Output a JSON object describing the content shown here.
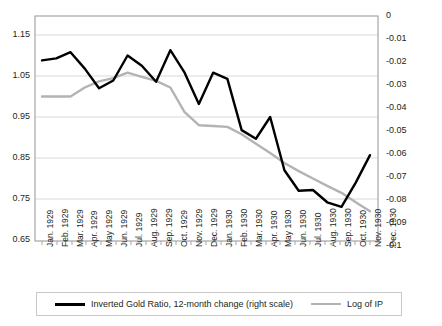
{
  "chart_data": {
    "type": "line",
    "title": "",
    "xlabel": "",
    "ylabel": "",
    "categories": [
      "Jan. 1929",
      "Feb. 1929",
      "Mar. 1929",
      "Apr. 1929",
      "May 1929",
      "Jun. 1929",
      "Jul. 1929",
      "Aug. 1929",
      "Sep. 1929",
      "Oct. 1929",
      "Nov. 1929",
      "Dec. 1929",
      "Jan. 1930",
      "Feb. 1930",
      "Mar. 1930",
      "Apr. 1930",
      "May 1930",
      "Jun. 1930",
      "Jul. 1930",
      "Aug. 1930",
      "Sep. 1930",
      "Oct. 1930",
      "Nov. 1930",
      "Dec. 1930"
    ],
    "left_axis": {
      "label": "",
      "ticks": [
        "1.15",
        "1.05",
        "0.95",
        "0.85",
        "0.75",
        "0.65"
      ],
      "tick_values": [
        1.15,
        1.05,
        0.95,
        0.85,
        0.75,
        0.65
      ],
      "ylim": [
        0.65,
        1.19
      ]
    },
    "right_axis": {
      "label": "",
      "ticks": [
        "0",
        "-0.01",
        "-0.02",
        "-0.03",
        "-0.04",
        "-0.05",
        "-0.06",
        "-0.07",
        "-0.08",
        "-0.09",
        "-0.1"
      ],
      "tick_values": [
        0,
        -0.01,
        -0.02,
        -0.03,
        -0.04,
        -0.05,
        -0.06,
        -0.07,
        -0.08,
        -0.09,
        -0.1
      ],
      "ylim": [
        -0.1,
        -0.0047
      ]
    },
    "grid": true,
    "legend_position": "bottom",
    "series": [
      {
        "name": "Inverted Gold Ratio, 12-month change (right scale)",
        "axis": "right",
        "color": "#000000",
        "values": [
          -0.0205,
          -0.0192,
          -0.0155,
          -0.0255,
          -0.0325,
          -0.0305,
          -0.0175,
          -0.0235,
          -0.03,
          -0.0163,
          -0.0283,
          -0.0385,
          -0.0265,
          -0.029,
          -0.0495,
          -0.056,
          -0.0455,
          -0.069,
          -0.079,
          -0.0785,
          -0.0855,
          -0.0875,
          -0.0755,
          -0.0605
        ],
        "values_left_scale": [
          1.088,
          1.093,
          1.108,
          1.068,
          1.02,
          1.039,
          1.1,
          1.075,
          1.036,
          1.113,
          1.058,
          0.982,
          1.058,
          1.043,
          0.918,
          0.897,
          0.95,
          0.82,
          0.77,
          0.772,
          0.742,
          0.731,
          0.79,
          0.857
        ]
      },
      {
        "name": "Log of IP",
        "axis": "right",
        "color": "#b3b3b3",
        "values": [
          -0.0368,
          -0.0368,
          -0.0368,
          -0.033,
          -0.0305,
          -0.029,
          -0.0268,
          -0.0283,
          -0.03,
          -0.033,
          -0.0425,
          -0.049,
          -0.0492,
          -0.0497,
          -0.0538,
          -0.059,
          -0.064,
          -0.0692,
          -0.073,
          -0.0765,
          -0.0798,
          -0.0832,
          -0.0875,
          -0.092
        ],
        "values_left_scale": [
          1.0,
          1.0,
          1.0,
          1.022,
          1.037,
          1.045,
          1.058,
          1.048,
          1.038,
          1.022,
          0.962,
          0.93,
          0.928,
          0.926,
          0.908,
          0.885,
          0.862,
          0.838,
          0.818,
          0.8,
          0.782,
          0.765,
          0.742,
          0.72
        ]
      }
    ]
  },
  "legend": {
    "entries": [
      {
        "label": "Inverted Gold Ratio, 12-month change (right scale)",
        "swatch": "black-line-swatch"
      },
      {
        "label": "Log of IP",
        "swatch": "gray-line-swatch"
      }
    ]
  },
  "colors": {
    "series_black": "#000000",
    "series_gray": "#b3b3b3",
    "grid": "#d9d9d9",
    "frame": "#a6a6a6",
    "text": "#231f20"
  }
}
